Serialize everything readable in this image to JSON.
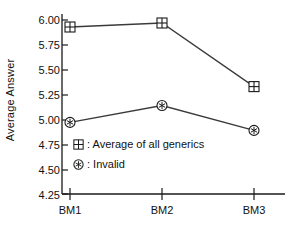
{
  "chart_data": {
    "type": "line",
    "title": "",
    "subtitle": "",
    "xlabel": "",
    "ylabel": "Average Answer",
    "categories": [
      "BM1",
      "BM2",
      "BM3"
    ],
    "ylim": [
      4.25,
      6.0
    ],
    "ytick_labels": [
      "6.00",
      "5.75",
      "5.50",
      "5.25",
      "5.00",
      "4.75",
      "4.50",
      "4.25"
    ],
    "ytick_values": [
      6.0,
      5.75,
      5.5,
      5.25,
      5.0,
      4.75,
      4.5,
      4.25
    ],
    "grid": false,
    "legend_position": "inside-lower-left",
    "series": [
      {
        "name": "Average of all generics",
        "marker": "square-crossed",
        "legend_label": ": Average of all generics",
        "values": [
          5.93,
          5.97,
          5.33
        ]
      },
      {
        "name": "Invalid",
        "marker": "circle-asterisk",
        "legend_label": ": Invalid",
        "values": [
          4.97,
          5.14,
          4.89
        ]
      }
    ],
    "colors": {
      "line": "#3a3a3a",
      "axis": "#1a1a1a",
      "marker_stroke": "#1a1a1a",
      "marker_fill": "#ffffff",
      "background": "#ffffff"
    }
  }
}
